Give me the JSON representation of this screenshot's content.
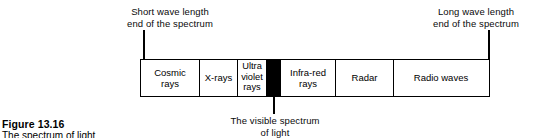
{
  "figure": {
    "number": "Figure 13.16",
    "subtitle": "The spectrum of light"
  },
  "annotations": {
    "short_wave": "Short wave length\nend of the spectrum",
    "long_wave": "Long wave length\nend of the spectrum",
    "visible_spectrum": "The visible spectrum\nof light"
  },
  "chart_data": {
    "type": "bar",
    "title": "Figure 13.16",
    "subtitle": "The spectrum of light",
    "orientation": "horizontal",
    "xlabel": "",
    "ylabel": "",
    "grid": false,
    "legend": null,
    "annotations": [
      "Short wave length end of the spectrum",
      "Long wave length end of the spectrum",
      "The visible spectrum of light"
    ],
    "categories": [
      "Cosmic rays",
      "X-rays",
      "Ultra violet rays",
      "",
      "Infra-red rays",
      "Radar",
      "Radio waves"
    ],
    "values": [
      59,
      38,
      29,
      14,
      55,
      58,
      94
    ],
    "bands": [
      {
        "label": "Cosmic\nrays",
        "width": 59,
        "fill": "#ffffff",
        "text_color": "#000000"
      },
      {
        "label": "X-rays",
        "width": 38,
        "fill": "#ffffff",
        "text_color": "#000000"
      },
      {
        "label": "Ultra\nviolet\nrays",
        "width": 29,
        "fill": "#ffffff",
        "text_color": "#000000"
      },
      {
        "label": "",
        "width": 14,
        "fill": "#000000",
        "text_color": "#ffffff"
      },
      {
        "label": "Infra-red\nrays",
        "width": 55,
        "fill": "#ffffff",
        "text_color": "#000000"
      },
      {
        "label": "Radar",
        "width": 58,
        "fill": "#ffffff",
        "text_color": "#000000"
      },
      {
        "label": "Radio waves",
        "width": 94,
        "fill": "#ffffff",
        "text_color": "#000000"
      }
    ],
    "colors": {
      "outline": "#000000",
      "background": "#ffffff",
      "visible_band": "#000000"
    }
  }
}
